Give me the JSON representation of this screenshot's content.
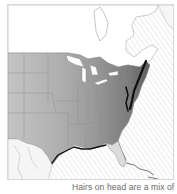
{
  "map": {
    "title": "Range map — eastern North America",
    "region": "Eastern and central United States with southern Canada",
    "shading": "grayscale density, darkest along Atlantic and Gulf coasts",
    "colors": {
      "land_light": "#f4f4f4",
      "land_mid": "#bdbdbd",
      "land_dark": "#7a7a7a",
      "coast_dense": "#111111",
      "ocean_hatch": "#e6e6e6",
      "borders": "#8a8a8a",
      "frame": "#d8d8d8"
    }
  },
  "caption": {
    "text": "Hairs on head are a mix of"
  }
}
